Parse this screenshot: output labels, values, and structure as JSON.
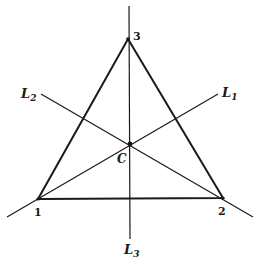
{
  "diagram": {
    "type": "triangle-with-concurrent-lines",
    "vertices": [
      {
        "id": "1",
        "label": "1"
      },
      {
        "id": "2",
        "label": "2"
      },
      {
        "id": "3",
        "label": "3"
      }
    ],
    "center": {
      "label": "C"
    },
    "lines": [
      {
        "id": "L1",
        "name": "L",
        "subscript": "1"
      },
      {
        "id": "L2",
        "name": "L",
        "subscript": "2"
      },
      {
        "id": "L3",
        "name": "L",
        "subscript": "3"
      }
    ],
    "colors": {
      "stroke": "#1a1a1a",
      "background": "#ffffff"
    }
  }
}
